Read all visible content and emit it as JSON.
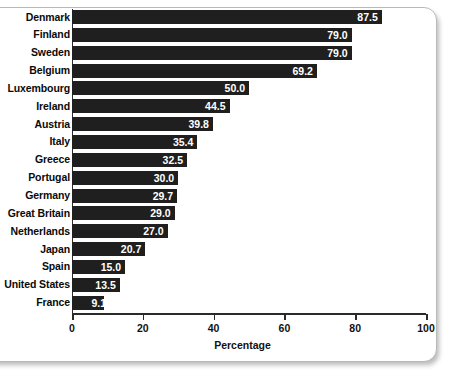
{
  "chart_data": {
    "type": "bar",
    "orientation": "horizontal",
    "title": "",
    "xlabel": "Percentage",
    "ylabel": "",
    "xlim": [
      0,
      100
    ],
    "grid": false,
    "legend": null,
    "xticks": [
      "0",
      "20",
      "40",
      "60",
      "80",
      "100"
    ],
    "categories": [
      "Denmark",
      "Finland",
      "Sweden",
      "Belgium",
      "Luxembourg",
      "Ireland",
      "Austria",
      "Italy",
      "Greece",
      "Portugal",
      "Germany",
      "Great Britain",
      "Netherlands",
      "Japan",
      "Spain",
      "United States",
      "France"
    ],
    "values": [
      87.5,
      79.0,
      79.0,
      69.2,
      50.0,
      44.5,
      39.8,
      35.4,
      32.5,
      30.0,
      29.7,
      29.0,
      27.0,
      20.7,
      15.0,
      13.5,
      9.1
    ],
    "value_labels": [
      "87.5",
      "79.0",
      "79.0",
      "69.2",
      "50.0",
      "44.5",
      "39.8",
      "35.4",
      "32.5",
      "30.0",
      "29.7",
      "29.0",
      "27.0",
      "20.7",
      "15.0",
      "13.5",
      "9.1"
    ],
    "bar_color": "#1f1f1f",
    "value_label_color": "#ffffff"
  }
}
